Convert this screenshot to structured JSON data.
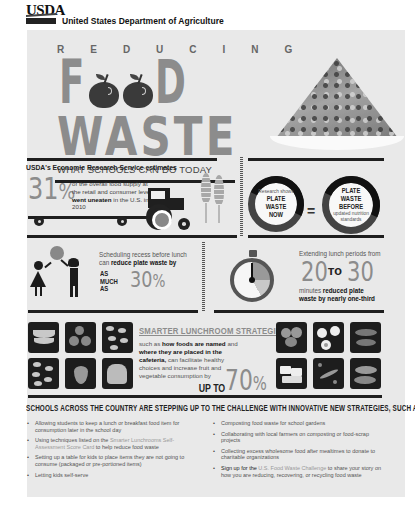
{
  "header": {
    "logo_text": "USDA",
    "agency_name": "United States Department of Agriculture"
  },
  "title": {
    "reducing": "REDUCING",
    "food_letters": [
      "F",
      "D"
    ],
    "waste": "WASTE",
    "subtitle": "WHAT SCHOOLS CAN DO TODAY"
  },
  "ers": {
    "heading": "USDA's Economic Research Service estimates",
    "percent": "31",
    "percent_symbol": "%",
    "desc_before": "of the overall food supply at the retail and consumer level ",
    "desc_bold": "went uneaten",
    "desc_after": " in the U.S. in 2010"
  },
  "plate_waste": {
    "left_small": "Research shows",
    "left_big": "PLATE WASTE NOW",
    "equals": "=",
    "right_big": "PLATE WASTE BEFORE",
    "right_small": "updated nutrition standards"
  },
  "recess": {
    "desc_before": "Scheduling recess before lunch can ",
    "desc_bold": "reduce plate waste by",
    "as_much_as": [
      "AS",
      "MUCH",
      "AS"
    ],
    "percent": "30",
    "percent_symbol": "%"
  },
  "lunch_period": {
    "desc": "Extending lunch periods from",
    "from": "20",
    "to": "TO",
    "until": "30",
    "desc2_before": "minutes ",
    "desc2_bold": "reduced plate waste by nearly one-third"
  },
  "smarter": {
    "title": "SMARTER LUNCHROOM STRATEGIES,",
    "desc_1": "such as ",
    "desc_bold_1": "how foods are named",
    "desc_2": " and ",
    "desc_bold_2": "where they are placed in the cafeteria,",
    "desc_3": " can facilitate healthy choices and increase fruit and vegetable consumption by",
    "up_to": "UP TO",
    "percent": "70",
    "percent_symbol": "%",
    "tiles_left": [
      "bananas",
      "strawberries",
      "orange-slices",
      "apple-slices",
      "grapes",
      "bread"
    ],
    "tiles_right": [
      "broccoli",
      "eggs",
      "fish",
      "tofu",
      "carrots-peas",
      "squash"
    ]
  },
  "strategies": {
    "title": "SCHOOLS ACROSS THE COUNTRY ARE STEPPING UP TO THE CHALLENGE WITH INNOVATIVE NEW STRATEGIES, SUCH AS:",
    "left": [
      {
        "text": "Allowing students to keep a lunch or breakfast food item for consumption later in the school day"
      },
      {
        "before": "Using techniques listed on the ",
        "link": "Smarter Lunchrooms Self-Assessment Score Card",
        "after": " to help reduce food waste"
      },
      {
        "text": "Setting up a table for kids to place items they are not going to consume (packaged or pre-portioned items)"
      },
      {
        "text": "Letting kids self-serve"
      }
    ],
    "right": [
      {
        "text": "Composting food waste for school gardens"
      },
      {
        "text": "Collaborating with local farmers on composting or food-scrap projects"
      },
      {
        "text": "Collecting excess wholesome food after mealtimes to donate to charitable organizations"
      },
      {
        "before": "Sign up for the ",
        "link": "U.S. Food Waste Challenge",
        "after": " to share your story on how you are reducing, recovering, or recycling food waste"
      }
    ]
  },
  "colors": {
    "panel_bg": "#e9e9e9",
    "accent_gray": "#8c8c8c",
    "dark": "#1e1e1e"
  }
}
